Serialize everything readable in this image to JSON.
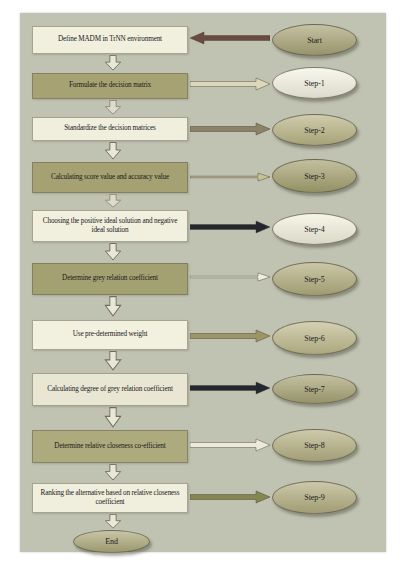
{
  "palette": {
    "page_bg": "#ffffff",
    "panel_bg": "#c1c3b2",
    "down_arrow_fill": "#e9e7d6",
    "down_arrow_stroke": "#6f6c5d",
    "text": "#1a1a1a"
  },
  "flowchart": {
    "rows": [
      {
        "box": "Define MADM in TrNN environment",
        "ellipse": "Start",
        "box_color": "#f1efde",
        "ellipse_color": "#a9a477",
        "arrow_color": "#6b4a42",
        "arrow_dir": "left"
      },
      {
        "box": "Formulate the decision matrix",
        "ellipse": "Step-1",
        "box_color": "#a6a273",
        "ellipse_color": "#f5f3e3",
        "arrow_color": "#ddd8ba",
        "arrow_dir": "right"
      },
      {
        "box": "Standardize the decision matrices",
        "ellipse": "Step-2",
        "box_color": "#f0eedd",
        "ellipse_color": "#b9b485",
        "arrow_color": "#8c8266",
        "arrow_dir": "right"
      },
      {
        "box": "Calculating score value and accuracy value",
        "ellipse": "Step-3",
        "box_color": "#a5a173",
        "ellipse_color": "#a5a170",
        "arrow_color": "#c6c095",
        "arrow_dir": "right"
      },
      {
        "box": "Choosing the positive ideal solution and negative ideal solution",
        "ellipse": "Step-4",
        "box_color": "#f1efde",
        "ellipse_color": "#f3f1de",
        "arrow_color": "#23262e",
        "arrow_dir": "right"
      },
      {
        "box": "Determine grey relation coefficient",
        "ellipse": "Step-5",
        "box_color": "#a3a071",
        "ellipse_color": "#b2ad7e",
        "arrow_color": "#f0eedb",
        "arrow_dir": "right"
      },
      {
        "box": "Use pre-determined weight",
        "ellipse": "Step-6",
        "box_color": "#f2f0df",
        "ellipse_color": "#bfba8d",
        "arrow_color": "#9c9566",
        "arrow_dir": "right"
      },
      {
        "box": "Calculating degree of grey relation coefficient",
        "ellipse": "Step-7",
        "box_color": "#e9e7d4",
        "ellipse_color": "#a7a375",
        "arrow_color": "#23272f",
        "arrow_dir": "right"
      },
      {
        "box": "Determine relative closeness co-efficient",
        "ellipse": "Step-8",
        "box_color": "#adaa7d",
        "ellipse_color": "#b5b083",
        "arrow_color": "#edeada",
        "arrow_dir": "right"
      },
      {
        "box": "Ranking the alternative based on relative closeness coefficient",
        "ellipse": "Step-9",
        "box_color": "#f0eedc",
        "ellipse_color": "#b3ae81",
        "arrow_color": "#84874f",
        "arrow_dir": "right"
      }
    ],
    "end": {
      "label": "End",
      "color": "#aeaa7c"
    }
  }
}
